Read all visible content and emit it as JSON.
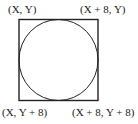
{
  "diagram": {
    "labels": {
      "top_left": "(X, Y)",
      "top_right": "(X + 8, Y)",
      "bottom_left": "(X, Y + 8)",
      "bottom_right": "(X + 8, Y + 8)"
    },
    "shapes": {
      "square": "square bounding box",
      "circle": "inscribed circle"
    },
    "colors": {
      "stroke": "#222222",
      "background": "#ffffff"
    }
  }
}
